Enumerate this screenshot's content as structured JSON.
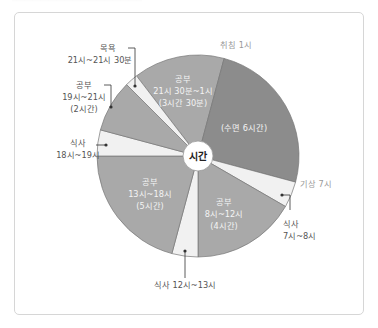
{
  "chart_data": {
    "type": "pie",
    "title": "",
    "center_label": "시간",
    "start_angle_note": "24-hour clock, 0시 at top, clockwise",
    "colors": {
      "sleep": "#8c8c8c",
      "study": "#a9a9a9",
      "meal": "#f1f1f1",
      "bath": "#f1f1f1"
    },
    "slices": [
      {
        "name": "공부",
        "start": "21:30",
        "end": "01:00",
        "hours": 3.5,
        "category": "study",
        "label": [
          "공부",
          "21시 30분~1시",
          "(3시간 30분)"
        ]
      },
      {
        "name": "수면",
        "start": "01:00",
        "end": "07:00",
        "hours": 6,
        "category": "sleep",
        "label": [
          "(수면 6시간)"
        ]
      },
      {
        "name": "식사",
        "start": "07:00",
        "end": "08:00",
        "hours": 1,
        "category": "meal",
        "label": [
          "식사",
          "7시~8시"
        ]
      },
      {
        "name": "공부",
        "start": "08:00",
        "end": "12:00",
        "hours": 4,
        "category": "study",
        "label": [
          "공부",
          "8시~12시",
          "(4시간)"
        ]
      },
      {
        "name": "식사",
        "start": "12:00",
        "end": "13:00",
        "hours": 1,
        "category": "meal",
        "label": [
          "식사 12시~13시"
        ]
      },
      {
        "name": "공부",
        "start": "13:00",
        "end": "18:00",
        "hours": 5,
        "category": "study",
        "label": [
          "공부",
          "13시~18시",
          "(5시간)"
        ]
      },
      {
        "name": "식사",
        "start": "18:00",
        "end": "19:00",
        "hours": 1,
        "category": "meal",
        "label": [
          "식사",
          "18시~19시"
        ]
      },
      {
        "name": "공부",
        "start": "19:00",
        "end": "21:00",
        "hours": 2,
        "category": "study",
        "label": [
          "공부",
          "19시~21시",
          "(2시간)"
        ]
      },
      {
        "name": "목욕",
        "start": "21:00",
        "end": "21:30",
        "hours": 0.5,
        "category": "bath",
        "label": [
          "목욕",
          "21시~21시 30분"
        ]
      }
    ],
    "annotations": [
      "취침 1시",
      "기상 7시"
    ]
  },
  "labels": {
    "center": "시간",
    "bedtime": "취침 1시",
    "wakeup": "기상 7시",
    "study_night": [
      "공부",
      "21시 30분~1시",
      "(3시간 30분)"
    ],
    "sleep": "(수면 6시간)",
    "meal_morning": [
      "식사",
      "7시~8시"
    ],
    "study_morning": [
      "공부",
      "8시~12시",
      "(4시간)"
    ],
    "meal_lunch": "식사 12시~13시",
    "study_afternoon": [
      "공부",
      "13시~18시",
      "(5시간)"
    ],
    "meal_dinner": [
      "식사",
      "18시~19시"
    ],
    "study_evening": [
      "공부",
      "19시~21시",
      "(2시간)"
    ],
    "bath": [
      "목욕",
      "21시~21시 30분"
    ]
  }
}
